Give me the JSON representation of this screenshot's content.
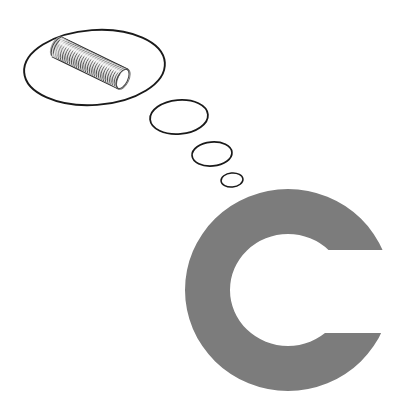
{
  "canvas": {
    "width": 394,
    "height": 416,
    "background_color": "#ffffff",
    "title": "Thought bubble with metal coil spring beside letter C"
  },
  "palette": {
    "background": "#ffffff",
    "outline": "#1a1a1a",
    "letter_gray": "#7c7c7c",
    "coil_wire_dark": "#4a4a4a",
    "coil_wire_mid": "#8e8e8e",
    "coil_wire_light": "#d8d8d8",
    "coil_highlight": "#f2f2f2"
  },
  "thought_bubble": {
    "label": "thought bubble",
    "outline_color": "#1a1a1a",
    "fill_color": "#ffffff",
    "main": {
      "label": "main thought bubble",
      "cx": 94.5,
      "cy": 67.5,
      "rx": 70.5,
      "ry": 37.5,
      "rotation_deg": -4,
      "stroke_width": 1.9
    },
    "trail": [
      {
        "label": "trail bubble large",
        "cx": 179,
        "cy": 117,
        "rx": 29,
        "ry": 17,
        "rotation_deg": -5,
        "stroke_width": 1.8
      },
      {
        "label": "trail bubble medium",
        "cx": 212,
        "cy": 154,
        "rx": 20,
        "ry": 12,
        "rotation_deg": -5,
        "stroke_width": 1.7
      },
      {
        "label": "trail bubble small",
        "cx": 232,
        "cy": 180,
        "rx": 11,
        "ry": 7,
        "rotation_deg": -5,
        "stroke_width": 1.5
      }
    ]
  },
  "coil": {
    "label": "metal coil spring",
    "description": "tightly wound helical metal wire cylinder, tilted diagonally",
    "center_x": 90,
    "center_y": 63,
    "length": 74,
    "radius_x": 11,
    "radius_y": 18,
    "tilt_deg": 26,
    "turns": 30,
    "wire_color_dark": "#4a4a4a",
    "wire_color_light": "#e2e2e2"
  },
  "letter": {
    "label": "letter C",
    "character": "C",
    "color": "#7c7c7c",
    "center_x": 288,
    "center_y": 290,
    "outer_rx": 103,
    "outer_ry": 101,
    "inner_rx": 58,
    "inner_ry": 56,
    "aperture_top_y": 250,
    "aperture_bottom_y": 333,
    "aperture_right_x": 394
  }
}
